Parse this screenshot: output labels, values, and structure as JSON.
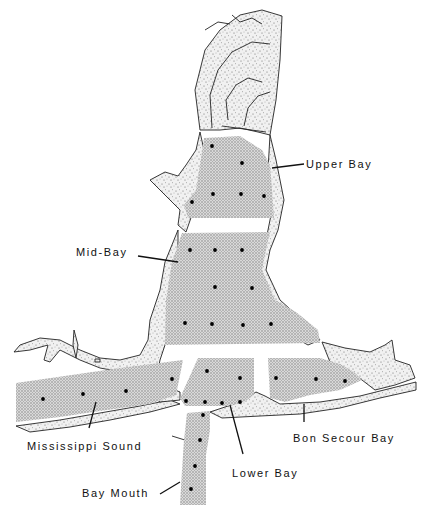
{
  "map": {
    "type": "sampling-station map",
    "colors": {
      "ink": "#111111",
      "water_fill": "#bdbdbd",
      "background": "#ffffff"
    },
    "regions": [
      {
        "name": "Upper Bay",
        "label_pos": [
          306,
          167
        ],
        "leader": [
          [
            272,
            168
          ],
          [
            304,
            164
          ]
        ],
        "stations": [
          [
            212,
            146
          ],
          [
            242,
            163
          ],
          [
            213,
            194
          ],
          [
            241,
            194
          ],
          [
            264,
            196
          ],
          [
            192,
            202
          ]
        ]
      },
      {
        "name": "Mid-Bay",
        "label_pos": [
          76,
          255
        ],
        "leader": [
          [
            138,
            256
          ],
          [
            178,
            262
          ]
        ],
        "stations": [
          [
            190,
            250
          ],
          [
            215,
            250
          ],
          [
            242,
            250
          ],
          [
            215,
            287
          ],
          [
            252,
            288
          ],
          [
            185,
            323
          ],
          [
            212,
            324
          ],
          [
            243,
            325
          ],
          [
            271,
            324
          ]
        ]
      },
      {
        "name": "Mississippi Sound",
        "label_pos": [
          27,
          449
        ],
        "leader": [
          [
            89,
            428
          ],
          [
            96,
            402
          ]
        ],
        "stations": [
          [
            43,
            399
          ],
          [
            83,
            394
          ],
          [
            126,
            391
          ],
          [
            172,
            379
          ]
        ]
      },
      {
        "name": "Lower Bay",
        "label_pos": [
          232,
          476
        ],
        "leader": [
          [
            243,
            454
          ],
          [
            230,
            405
          ]
        ],
        "stations": [
          [
            207,
            371
          ],
          [
            240,
            378
          ],
          [
            186,
            401
          ],
          [
            205,
            402
          ],
          [
            222,
            403
          ],
          [
            240,
            402
          ]
        ]
      },
      {
        "name": "Bon Secour Bay",
        "label_pos": [
          293,
          441
        ],
        "leader": [
          [
            304,
            404
          ],
          [
            304,
            422
          ]
        ],
        "stations": [
          [
            276,
            378
          ],
          [
            316,
            379
          ],
          [
            345,
            381
          ]
        ]
      },
      {
        "name": "Bay Mouth",
        "label_pos": [
          82,
          496
        ],
        "leader": [
          [
            160,
            494
          ],
          [
            180,
            482
          ]
        ],
        "stations": [
          [
            203,
            415
          ],
          [
            200,
            440
          ],
          [
            195,
            466
          ],
          [
            191,
            489
          ]
        ]
      }
    ]
  },
  "labels": {
    "upper_bay": "Upper Bay",
    "mid_bay": "Mid-Bay",
    "mississippi_sound": "Mississippi Sound",
    "lower_bay": "Lower Bay",
    "bon_secour_bay": "Bon Secour Bay",
    "bay_mouth": "Bay Mouth"
  }
}
